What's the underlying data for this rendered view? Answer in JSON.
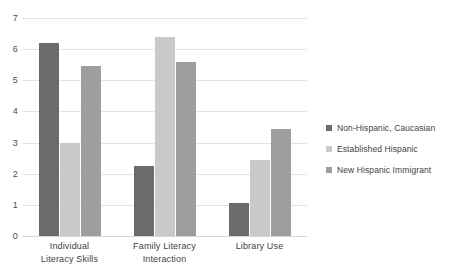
{
  "chart_data": {
    "type": "bar",
    "title": "",
    "subtitle": "",
    "xlabel": "",
    "ylabel": "",
    "ylim": [
      0,
      7
    ],
    "ytick_step": 1,
    "yticks": [
      "7",
      "6",
      "5",
      "4",
      "3",
      "2",
      "1",
      "0"
    ],
    "grid": true,
    "legend_position": "right",
    "categories": [
      "Individual Literacy Skills",
      "Family Literacy Interaction",
      "Library Use"
    ],
    "category_lines": [
      [
        "Individual",
        "Literacy Skills"
      ],
      [
        "Family Literacy",
        "Interaction"
      ],
      [
        "Library Use",
        ""
      ]
    ],
    "series": [
      {
        "name": "Non-Hispanic, Caucasian",
        "color": "#6b6b6b",
        "values": [
          6.2,
          2.25,
          1.05
        ]
      },
      {
        "name": "Established Hispanic",
        "color": "#c9c9c9",
        "values": [
          3.0,
          6.4,
          2.45
        ]
      },
      {
        "name": "New Hispanic Immigrant",
        "color": "#9e9e9e",
        "values": [
          5.45,
          5.6,
          3.45
        ]
      }
    ]
  },
  "legend": {
    "items": [
      {
        "label": "Non-Hispanic, Caucasian",
        "color": "#6b6b6b"
      },
      {
        "label": "Established Hispanic",
        "color": "#c9c9c9"
      },
      {
        "label": "New Hispanic Immigrant",
        "color": "#9e9e9e"
      }
    ]
  },
  "colors": {
    "gridline": "#e4e4e4",
    "axis_text": "#4d4d4d",
    "background": "#ffffff"
  }
}
